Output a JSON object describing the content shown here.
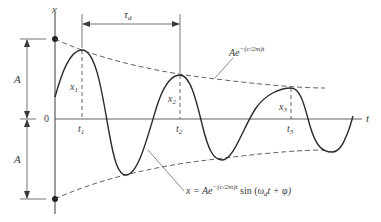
{
  "diagram": {
    "type": "damped-oscillation",
    "axes": {
      "vertical_label": "x",
      "horizontal_label": "t",
      "origin_label": "0"
    },
    "amplitude_labels": {
      "upper": "A",
      "lower": "A"
    },
    "period_label": {
      "main": "τ",
      "sub": "d"
    },
    "time_marks": [
      {
        "main": "t",
        "sub": "1"
      },
      {
        "main": "t",
        "sub": "2"
      },
      {
        "main": "t",
        "sub": "3"
      }
    ],
    "peak_labels": [
      {
        "main": "x",
        "sub": "1"
      },
      {
        "main": "x",
        "sub": "2"
      },
      {
        "main": "x",
        "sub": "3"
      }
    ],
    "envelope_label": {
      "base": "Ae",
      "exponent": "−(c/2m)t"
    },
    "curve_label": {
      "lhs": "x = Ae",
      "exponent": "−(c/2m)t",
      "rhs_prefix": " sin (ω",
      "rhs_sub": "d",
      "rhs_suffix": "t + φ)"
    },
    "colors": {
      "line": "#3a3a3a",
      "background": "#ffffff"
    }
  }
}
